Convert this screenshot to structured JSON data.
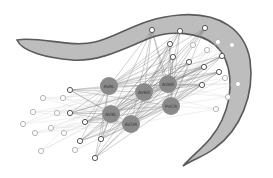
{
  "diagram": {
    "title": "",
    "colors": {
      "body_fill": "#bdbdbd",
      "body_stroke": "#5a5a5a",
      "hub_fill": "#8a8a8a",
      "edge_dark": "#6a6a6a",
      "edge_light": "#c8c8c8",
      "node_stroke_dark": "#555555",
      "node_stroke_light": "#b5b5b5"
    },
    "hubs": [
      {
        "id": "AVAL",
        "label": "AVAL",
        "x": 109,
        "y": 86,
        "r": 9
      },
      {
        "id": "AVBR",
        "label": "AVBR",
        "x": 144,
        "y": 92,
        "r": 9
      },
      {
        "id": "AVAR",
        "label": "AVAR",
        "x": 168,
        "y": 84,
        "r": 9
      },
      {
        "id": "PVCR",
        "label": "PVCR",
        "x": 171,
        "y": 106,
        "r": 9
      },
      {
        "id": "AVBL",
        "label": "AVBL",
        "x": 111,
        "y": 114,
        "r": 9
      },
      {
        "id": "AVDR",
        "label": "AVDR",
        "x": 131,
        "y": 124,
        "r": 9
      }
    ],
    "nodes": [
      {
        "x": 152,
        "y": 30,
        "tone": "dark"
      },
      {
        "x": 180,
        "y": 31,
        "tone": "dark"
      },
      {
        "x": 205,
        "y": 28,
        "tone": "dark"
      },
      {
        "x": 170,
        "y": 44,
        "tone": "dark"
      },
      {
        "x": 193,
        "y": 45,
        "tone": "light"
      },
      {
        "x": 218,
        "y": 42,
        "tone": "light"
      },
      {
        "x": 232,
        "y": 45,
        "tone": "light"
      },
      {
        "x": 207,
        "y": 50,
        "tone": "light"
      },
      {
        "x": 222,
        "y": 56,
        "tone": "dark"
      },
      {
        "x": 173,
        "y": 57,
        "tone": "dark"
      },
      {
        "x": 189,
        "y": 62,
        "tone": "dark"
      },
      {
        "x": 204,
        "y": 67,
        "tone": "dark"
      },
      {
        "x": 219,
        "y": 72,
        "tone": "dark"
      },
      {
        "x": 225,
        "y": 78,
        "tone": "light"
      },
      {
        "x": 238,
        "y": 84,
        "tone": "light"
      },
      {
        "x": 202,
        "y": 85,
        "tone": "dark"
      },
      {
        "x": 228,
        "y": 97,
        "tone": "light"
      },
      {
        "x": 216,
        "y": 109,
        "tone": "light"
      },
      {
        "x": 70,
        "y": 90,
        "tone": "dark"
      },
      {
        "x": 43,
        "y": 98,
        "tone": "light"
      },
      {
        "x": 63,
        "y": 98,
        "tone": "light"
      },
      {
        "x": 33,
        "y": 112,
        "tone": "light"
      },
      {
        "x": 57,
        "y": 113,
        "tone": "light"
      },
      {
        "x": 70,
        "y": 113,
        "tone": "dark"
      },
      {
        "x": 23,
        "y": 124,
        "tone": "light"
      },
      {
        "x": 51,
        "y": 128,
        "tone": "light"
      },
      {
        "x": 85,
        "y": 122,
        "tone": "dark"
      },
      {
        "x": 35,
        "y": 133,
        "tone": "light"
      },
      {
        "x": 64,
        "y": 133,
        "tone": "light"
      },
      {
        "x": 80,
        "y": 141,
        "tone": "dark"
      },
      {
        "x": 101,
        "y": 139,
        "tone": "dark"
      },
      {
        "x": 75,
        "y": 150,
        "tone": "light"
      },
      {
        "x": 41,
        "y": 151,
        "tone": "light"
      },
      {
        "x": 95,
        "y": 158,
        "tone": "dark"
      }
    ]
  }
}
